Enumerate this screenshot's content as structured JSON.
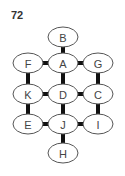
{
  "puzzle": {
    "number": "72"
  },
  "nodes": [
    {
      "id": "B",
      "label": "B",
      "cx": 63,
      "cy": 37
    },
    {
      "id": "F",
      "label": "F",
      "cx": 28,
      "cy": 63
    },
    {
      "id": "A",
      "label": "A",
      "cx": 63,
      "cy": 63
    },
    {
      "id": "G",
      "label": "G",
      "cx": 98,
      "cy": 63
    },
    {
      "id": "K",
      "label": "K",
      "cx": 28,
      "cy": 94
    },
    {
      "id": "D",
      "label": "D",
      "cx": 63,
      "cy": 94
    },
    {
      "id": "C",
      "label": "C",
      "cx": 98,
      "cy": 94
    },
    {
      "id": "E",
      "label": "E",
      "cx": 28,
      "cy": 124
    },
    {
      "id": "J",
      "label": "J",
      "cx": 63,
      "cy": 124
    },
    {
      "id": "I",
      "label": "I",
      "cx": 98,
      "cy": 124
    },
    {
      "id": "H",
      "label": "H",
      "cx": 63,
      "cy": 153
    }
  ],
  "edges": [
    [
      "B",
      "A"
    ],
    [
      "F",
      "A"
    ],
    [
      "A",
      "G"
    ],
    [
      "F",
      "K"
    ],
    [
      "A",
      "D"
    ],
    [
      "G",
      "C"
    ],
    [
      "K",
      "D"
    ],
    [
      "D",
      "C"
    ],
    [
      "K",
      "E"
    ],
    [
      "D",
      "J"
    ],
    [
      "C",
      "I"
    ],
    [
      "E",
      "J"
    ],
    [
      "J",
      "I"
    ],
    [
      "J",
      "H"
    ]
  ]
}
